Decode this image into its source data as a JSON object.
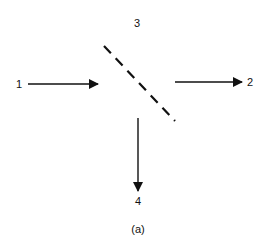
{
  "diagram": {
    "ports": {
      "p1": "1",
      "p2": "2",
      "p3": "3",
      "p4": "4"
    },
    "caption": "(a)",
    "elements": {
      "beam_splitter": "dashed diagonal line (beam splitter)",
      "input_arrow": "arrow from port 1 toward splitter",
      "transmitted_arrow": "arrow from splitter to port 2",
      "reflected_arrow": "arrow from splitter down to port 4"
    },
    "colors": {
      "stroke": "#111111",
      "background": "#ffffff"
    }
  }
}
